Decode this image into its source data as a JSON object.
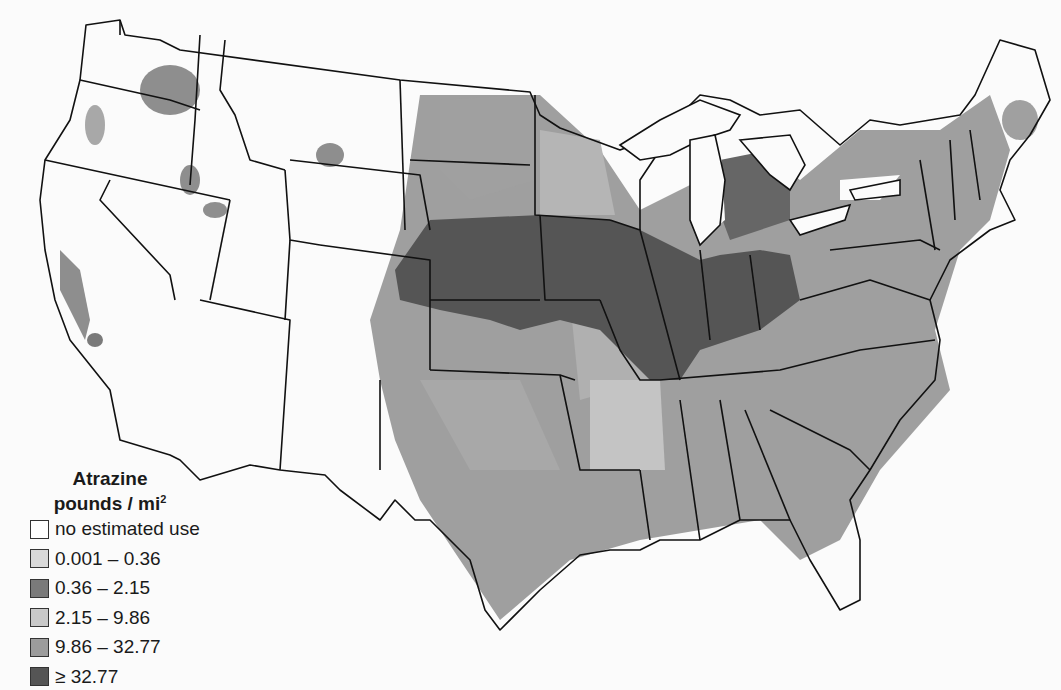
{
  "map": {
    "subject": "Atrazine estimated agricultural use, conterminous United States",
    "background": "#fbfbfb",
    "outline_color": "#111111"
  },
  "legend": {
    "title_line1": "Atrazine",
    "title_line2": "pounds / mi",
    "title_sup": "2",
    "items": [
      {
        "label": "no estimated use",
        "color": "#ffffff"
      },
      {
        "label": "0.001 – 0.36",
        "color": "#d9d9d9"
      },
      {
        "label": "0.36 – 2.15",
        "color": "#7a7a7a"
      },
      {
        "label": "2.15 – 9.86",
        "color": "#c8c8c8"
      },
      {
        "label": "9.86 – 32.77",
        "color": "#9c9c9c"
      },
      {
        "label": "≥ 32.77",
        "color": "#555555"
      }
    ]
  }
}
